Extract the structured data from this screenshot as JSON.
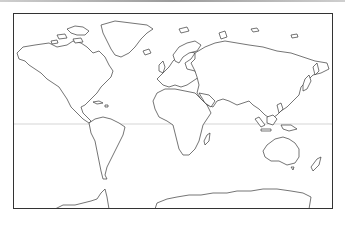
{
  "map": {
    "type": "world-outline",
    "projection": "equirectangular",
    "colors": {
      "ocean": "#ffffff",
      "land_fill": "#ffffff",
      "coastline": "#3a3a3a",
      "equator": "#b8b8b8",
      "frame": "#333333"
    },
    "features": [
      "North America",
      "Greenland",
      "South America",
      "Europe",
      "Africa",
      "Asia",
      "Australia",
      "Antarctica",
      "Equator line"
    ]
  }
}
